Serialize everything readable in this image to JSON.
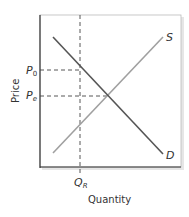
{
  "diagram": {
    "type": "supply-demand",
    "axes": {
      "x_label": "Quantity",
      "y_label": "Price"
    },
    "curves": [
      {
        "name": "S",
        "label": "S",
        "kind": "supply",
        "color": "#9a9a9a"
      },
      {
        "name": "D",
        "label": "D",
        "kind": "demand",
        "color": "#555555"
      }
    ],
    "reference_lines": [
      {
        "label": "P",
        "subscript": "0",
        "axis": "price"
      },
      {
        "label": "P",
        "subscript": "e",
        "axis": "price"
      },
      {
        "label": "Q",
        "subscript": "R",
        "axis": "quantity"
      }
    ],
    "colors": {
      "frame": "#333333",
      "dash": "#444444",
      "shadow": "#dddddd"
    }
  }
}
